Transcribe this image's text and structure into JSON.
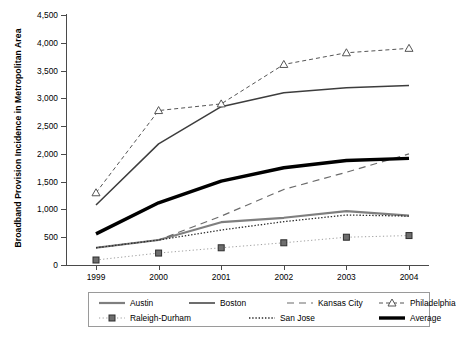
{
  "chart_data": {
    "type": "line",
    "title": "",
    "xlabel": "",
    "ylabel": "Broadband Provision Incidence in Metropolitan Area",
    "categories": [
      "1999",
      "2000",
      "2001",
      "2002",
      "2003",
      "2004"
    ],
    "x": [
      1999,
      2000,
      2001,
      2002,
      2003,
      2004
    ],
    "ylim": [
      0,
      4500
    ],
    "yticks": [
      0,
      500,
      1000,
      1500,
      2000,
      2500,
      3000,
      3500,
      4000,
      4500
    ],
    "ytick_labels": [
      "0",
      "500",
      "1,000",
      "1,500",
      "2,000",
      "2,500",
      "3,000",
      "3,500",
      "4,000",
      "4,500"
    ],
    "grid": false,
    "legend_position": "bottom",
    "series": [
      {
        "name": "Austin",
        "values": [
          310,
          450,
          770,
          850,
          970,
          890
        ],
        "color": "#7f7f7f",
        "style": "solid",
        "width": 2.2,
        "marker": "none"
      },
      {
        "name": "Boston",
        "values": [
          1080,
          2180,
          2850,
          3100,
          3190,
          3230
        ],
        "color": "#3d3d3d",
        "style": "solid",
        "width": 1.5,
        "marker": "none"
      },
      {
        "name": "Kansas City",
        "values": [
          310,
          450,
          880,
          1360,
          1670,
          2000
        ],
        "color": "#6b6b6b",
        "style": "dashed",
        "width": 1.2,
        "marker": "none"
      },
      {
        "name": "Philadelphia",
        "values": [
          1300,
          2780,
          2900,
          3610,
          3820,
          3900
        ],
        "color": "#555555",
        "style": "dashed-fine",
        "width": 1.0,
        "marker": "triangle"
      },
      {
        "name": "Raleigh-Durham",
        "values": [
          90,
          215,
          310,
          400,
          500,
          530
        ],
        "color": "#9e9e9e",
        "style": "dotted",
        "width": 1.0,
        "marker": "square"
      },
      {
        "name": "San Jose",
        "values": [
          310,
          450,
          630,
          780,
          900,
          880
        ],
        "color": "#2b2b2b",
        "style": "dotted",
        "width": 1.3,
        "marker": "none"
      },
      {
        "name": "Average",
        "values": [
          560,
          1120,
          1510,
          1750,
          1880,
          1920
        ],
        "color": "#000000",
        "style": "solid",
        "width": 3.4,
        "marker": "none"
      }
    ]
  },
  "legend": {
    "rows": [
      [
        "Austin",
        "Boston",
        "Kansas City",
        "Philadelphia"
      ],
      [
        "Raleigh-Durham",
        "San Jose",
        "Average"
      ]
    ]
  }
}
